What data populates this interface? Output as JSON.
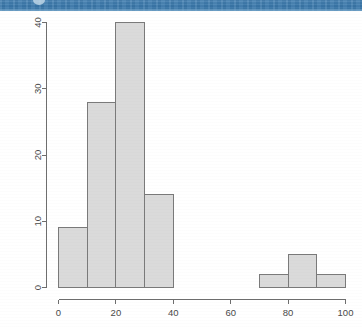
{
  "banner": {
    "name": "page-header-strip",
    "color": "#3f7cae",
    "accent": "#6fa0c6"
  },
  "figure": {
    "background": "#ffffff",
    "bar_fill": "#dadada",
    "bar_border": "#7a7a7a",
    "axis_color": "#6e6e6e",
    "label_color": "#4a4a4a"
  },
  "chart_data": {
    "type": "bar",
    "title": "",
    "subtitle": "",
    "xlabel": "",
    "ylabel": "",
    "grid": false,
    "legend": "none",
    "xlim": [
      0,
      100
    ],
    "ylim": [
      0,
      40
    ],
    "bin_width": 10,
    "x_ticks": [
      0,
      20,
      40,
      60,
      80,
      100
    ],
    "x_tick_labels": [
      "0",
      "20",
      "40",
      "60",
      "80",
      "100"
    ],
    "y_ticks": [
      0,
      10,
      20,
      30,
      40
    ],
    "y_tick_labels": [
      "0",
      "10",
      "20",
      "30",
      "40"
    ],
    "y_tick_label_rotation": -90,
    "bins": [
      {
        "x0": 0,
        "x1": 10,
        "value": 9
      },
      {
        "x0": 10,
        "x1": 20,
        "value": 28
      },
      {
        "x0": 20,
        "x1": 30,
        "value": 40
      },
      {
        "x0": 30,
        "x1": 40,
        "value": 14
      },
      {
        "x0": 40,
        "x1": 50,
        "value": 0
      },
      {
        "x0": 50,
        "x1": 60,
        "value": 0
      },
      {
        "x0": 60,
        "x1": 70,
        "value": 0
      },
      {
        "x0": 70,
        "x1": 80,
        "value": 2
      },
      {
        "x0": 80,
        "x1": 90,
        "value": 5
      },
      {
        "x0": 90,
        "x1": 100,
        "value": 2
      }
    ],
    "categories": [
      "0-10",
      "10-20",
      "20-30",
      "30-40",
      "40-50",
      "50-60",
      "60-70",
      "70-80",
      "80-90",
      "90-100"
    ],
    "values": [
      9,
      28,
      40,
      14,
      0,
      0,
      0,
      2,
      5,
      2
    ]
  }
}
